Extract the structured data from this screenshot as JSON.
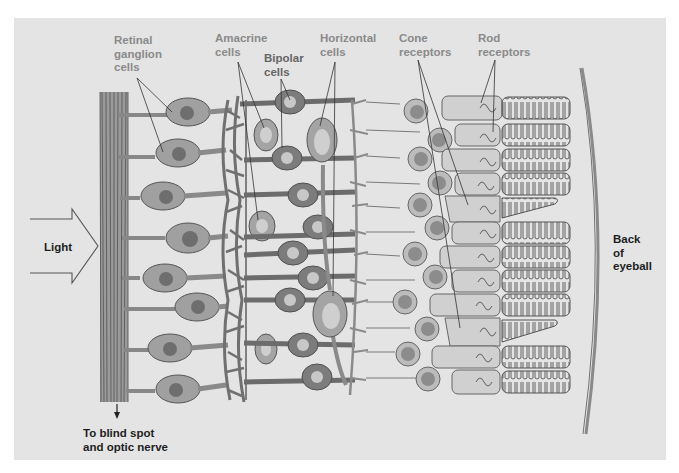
{
  "figure": {
    "colors": {
      "panel_bg": "#e4e4e4",
      "label_gray": "#8a8a8a",
      "label_dark": "#1e1e1e",
      "cell_body": "#9a9a9a",
      "nucleus_dark": "#6e6e6e",
      "bipolar_body": "#7c7c7c",
      "bipolar_nucleus": "#c8c8c8",
      "receptor_fill": "#cfcfcf",
      "outline": "#555555"
    }
  },
  "labels": {
    "retinal_ganglion": "Retinal\nganglion\ncells",
    "amacrine": "Amacrine\ncells",
    "bipolar": "Bipolar\ncells",
    "horizontal": "Horizontal\ncells",
    "cone": "Cone\nreceptors",
    "rod": "Rod\nreceptors",
    "light": "Light",
    "back_of_eyeball": "Back\nof\neyeball",
    "blind_spot": "To blind spot\nand optic nerve"
  },
  "layers": [
    "Optic nerve fibers",
    "Retinal ganglion cells",
    "Amacrine cells",
    "Bipolar cells",
    "Horizontal cells",
    "Cone receptors",
    "Rod receptors",
    "Back of eyeball"
  ]
}
